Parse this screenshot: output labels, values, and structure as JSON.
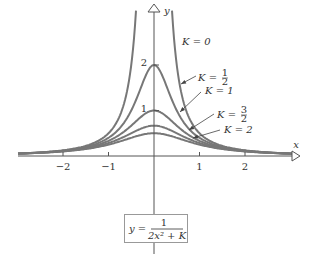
{
  "chart_data": {
    "type": "line",
    "title": "",
    "xlabel": "x",
    "ylabel": "y",
    "formula": {
      "lhs": "y =",
      "numerator": "1",
      "denominator": "2x² + K"
    },
    "x_ticks": [
      {
        "v": -2,
        "label": "−2"
      },
      {
        "v": -1,
        "label": "−1"
      },
      {
        "v": 1,
        "label": "1"
      },
      {
        "v": 2,
        "label": "2"
      }
    ],
    "y_ticks": [
      {
        "v": 1,
        "label": "1"
      },
      {
        "v": 2,
        "label": "2"
      }
    ],
    "xlim": [
      -3,
      3.1
    ],
    "ylim": [
      0,
      3.4
    ],
    "grid": false,
    "series": [
      {
        "name": "K = 0",
        "K": 0,
        "peak": null
      },
      {
        "name": "K = 1/2",
        "K": 0.5,
        "peak": 2
      },
      {
        "name": "K = 1",
        "K": 1,
        "peak": 1
      },
      {
        "name": "K = 3/2",
        "K": 1.5,
        "peak": 0.667
      },
      {
        "name": "K = 2",
        "K": 2,
        "peak": 0.5
      }
    ],
    "annotations": [
      "K = 0",
      "K = 1/2",
      "K = 1",
      "K = 3/2",
      "K = 2"
    ],
    "color": "#777777"
  }
}
